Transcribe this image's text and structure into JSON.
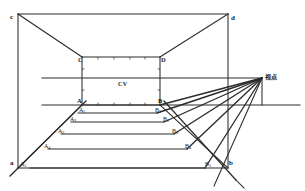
{
  "figure": {
    "kind": "perspective-construction-diagram",
    "title_text": "",
    "stroke_color": "#2b2b2b",
    "background_color": "#ffffff",
    "labels": {
      "outer_top_left": "c",
      "outer_top_right": "d",
      "outer_bottom_left": "a",
      "outer_bottom_right": "b",
      "inner_top_left": "C",
      "inner_top_right": "D",
      "inner_bottom_left": "A",
      "inner_bottom_right": "B",
      "center_of_vision": "CV",
      "viewpoint": "视点"
    },
    "left_series": [
      {
        "base": "A",
        "sub": ""
      },
      {
        "base": "A",
        "sub": "1"
      },
      {
        "base": "A",
        "sub": "2"
      },
      {
        "base": "A",
        "sub": "3"
      },
      {
        "base": "A",
        "sub": "4"
      },
      {
        "base": "A",
        "sub": "5"
      }
    ],
    "right_series": [
      {
        "base": "B",
        "sub": ""
      },
      {
        "base": "B",
        "sub": "1"
      },
      {
        "base": "B",
        "sub": "2"
      },
      {
        "base": "B",
        "sub": "3"
      },
      {
        "base": "B",
        "sub": "4"
      },
      {
        "base": "B",
        "sub": "5"
      }
    ],
    "geometry": {
      "outer_rect": {
        "left": 18,
        "top": 14,
        "right": 228,
        "bottom": 168
      },
      "inner_rect": {
        "left": 82,
        "top": 57,
        "right": 160,
        "bottom": 105
      },
      "horizon_line": {
        "x1": 42,
        "y1": 78,
        "x2": 262,
        "y2": 78
      },
      "ground_line": {
        "x1": 42,
        "y1": 105,
        "x2": 300,
        "y2": 105
      },
      "vanishing_point": {
        "x": 262,
        "y": 78
      },
      "station_point": {
        "x": 262,
        "y": 105
      },
      "depth_rows_y": [
        105,
        113,
        122,
        134,
        149,
        168
      ]
    }
  }
}
